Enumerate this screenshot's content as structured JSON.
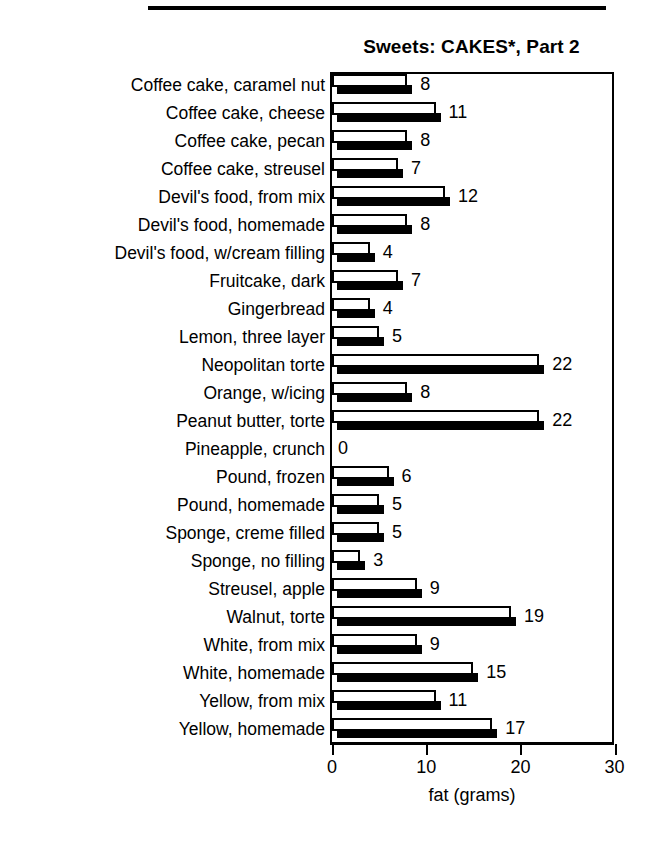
{
  "page": {
    "background": "#ffffff",
    "ink": "#000000",
    "top_rule": true
  },
  "chart_data": {
    "type": "bar",
    "orientation": "horizontal",
    "title": "Sweets: CAKES*, Part 2",
    "xlabel": "fat (grams)",
    "ylabel": "",
    "xlim": [
      0,
      30
    ],
    "xticks": [
      0,
      10,
      20,
      30
    ],
    "xtick_labels": [
      "0",
      "10",
      "20",
      "30"
    ],
    "grid": false,
    "legend": false,
    "legend_position": "none",
    "bar_style": "white-bar-with-black-drop-shadow",
    "categories": [
      "Coffee cake, caramel nut",
      "Coffee cake, cheese",
      "Coffee cake, pecan",
      "Coffee cake, streusel",
      "Devil's food, from mix",
      "Devil's food, homemade",
      "Devil's food, w/cream filling",
      "Fruitcake, dark",
      "Gingerbread",
      "Lemon, three layer",
      "Neopolitan torte",
      "Orange, w/icing",
      "Peanut butter, torte",
      "Pineapple, crunch",
      "Pound, frozen",
      "Pound, homemade",
      "Sponge, creme filled",
      "Sponge, no filling",
      "Streusel, apple",
      "Walnut, torte",
      "White, from mix",
      "White, homemade",
      "Yellow, from mix",
      "Yellow, homemade"
    ],
    "values": [
      8,
      11,
      8,
      7,
      12,
      8,
      4,
      7,
      4,
      5,
      22,
      8,
      22,
      0,
      6,
      5,
      5,
      3,
      9,
      19,
      9,
      15,
      11,
      17
    ],
    "value_labels": [
      "8",
      "11",
      "8",
      "7",
      "12",
      "8",
      "4",
      "7",
      "4",
      "5",
      "22",
      "8",
      "22",
      "0",
      "6",
      "5",
      "5",
      "3",
      "9",
      "19",
      "9",
      "15",
      "11",
      "17"
    ],
    "units": "grams of fat"
  }
}
